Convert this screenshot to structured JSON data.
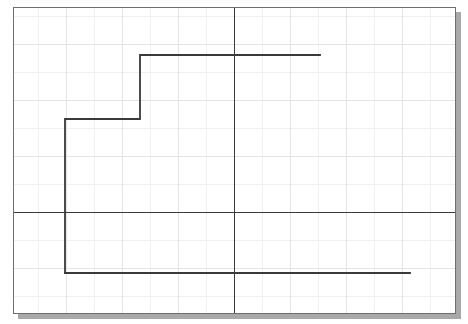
{
  "figure": {
    "title": "",
    "background_color": "#ffffff",
    "frame_border_color": "#6e6e6e",
    "shadow_color": "#a9a9a9",
    "grid_minor_color": "#f0f0f0",
    "grid_major_color": "#e4e4e4",
    "axis_color": "#3a3a3a",
    "data_line_color": "#3a3a3a",
    "data_line_width": 1.8
  },
  "chart_data": {
    "type": "line",
    "subtype": "step",
    "title": "",
    "xlabel": "",
    "ylabel": "",
    "grid": true,
    "legend": null,
    "xlim": [
      -8,
      8
    ],
    "ylim": [
      -4,
      7
    ],
    "axes": {
      "x_axis_y_value": 0,
      "y_axis_x_value": 0,
      "x_axis_pixel_y": 204,
      "y_axis_pixel_x": 220,
      "show_x_axis": true,
      "show_y_axis": true,
      "show_ticks": false,
      "show_tick_labels": false
    },
    "grid_spacing": {
      "major_x_px": 56,
      "major_y_px": 56,
      "minor_x_px": 28,
      "minor_y_px": 28
    },
    "series": [
      {
        "name": "step function",
        "step_mode": "post",
        "x": [
          -6.2,
          -6.2,
          -3.5,
          -3.5,
          2.2
        ],
        "y": [
          -3.4,
          1.6,
          1.6,
          4.3,
          4.3
        ],
        "segments": [
          {
            "type": "horizontal",
            "x_start": -6.2,
            "x_end": 5.4,
            "y": -3.4
          },
          {
            "type": "vertical",
            "x": -6.2,
            "y_start": -3.4,
            "y_end": 1.6
          },
          {
            "type": "horizontal",
            "x_start": -6.2,
            "x_end": -3.5,
            "y": 1.6
          },
          {
            "type": "vertical",
            "x": -3.5,
            "y_start": 1.6,
            "y_end": 4.3
          },
          {
            "type": "horizontal",
            "x_start": -3.5,
            "x_end": 2.2,
            "y": 4.3
          }
        ],
        "pixel_vertices": [
          {
            "x": 51,
            "y": 265
          },
          {
            "x": 51,
            "y": 111
          },
          {
            "x": 126,
            "y": 111
          },
          {
            "x": 126,
            "y": 47
          },
          {
            "x": 306,
            "y": 47
          }
        ],
        "pixel_bottom_tail_end": {
          "x": 396,
          "y": 265
        }
      }
    ]
  }
}
